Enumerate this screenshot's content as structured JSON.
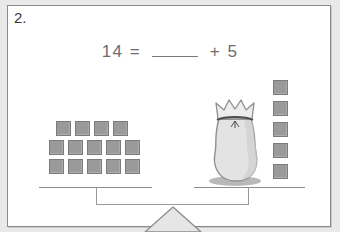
{
  "worksheet": {
    "problem_number": "2.",
    "equation": {
      "left_operand": "14",
      "equals": "=",
      "blank": "",
      "plus": "+",
      "right_operand": "5",
      "full_text": "14 = ____ + 5"
    }
  },
  "balance": {
    "left_pan": {
      "label": "left-pan",
      "object_type": "unit-squares",
      "total_count": 14,
      "rows": [
        {
          "count": 4,
          "squares": [
            "1",
            "2",
            "3",
            "4"
          ]
        },
        {
          "count": 5,
          "squares": [
            "1",
            "2",
            "3",
            "4",
            "5"
          ]
        },
        {
          "count": 5,
          "squares": [
            "1",
            "2",
            "3",
            "4",
            "5"
          ]
        }
      ]
    },
    "right_pan": {
      "label": "right-pan",
      "bag": {
        "name": "mystery-bag",
        "contents_unknown": true
      },
      "column": {
        "object_type": "unit-squares",
        "total_count": 5,
        "squares": [
          "1",
          "2",
          "3",
          "4",
          "5"
        ]
      }
    },
    "fulcrum": {
      "name": "triangle-fulcrum"
    }
  },
  "colors": {
    "page_background": "#e9e9e9",
    "card_background": "#ffffff",
    "card_border": "#8a8a8a",
    "square_fill": "#9a9a9a",
    "square_border": "#7b7b7b",
    "line": "#8d8d8d",
    "text": "#6d6d6d",
    "number_text": "#3a3a3a",
    "bag_fill": "#e3e3e3",
    "bag_border": "#8f8f8f",
    "fulcrum_fill": "#e6e6e6"
  }
}
